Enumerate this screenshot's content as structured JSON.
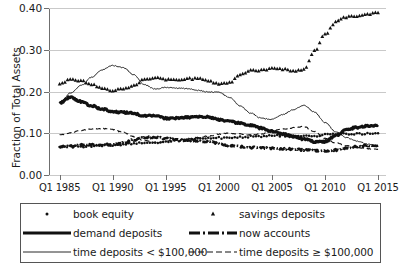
{
  "chart_data": {
    "type": "line",
    "title": "",
    "xlabel": "",
    "ylabel": "Fraction of Total Assets",
    "ylim": [
      0.0,
      0.4
    ],
    "xlim": [
      1984.0,
      2015.75
    ],
    "grid": true,
    "legend_position": "below-plot",
    "yticks": [
      "0.00",
      "0.10",
      "0.20",
      "0.30",
      "0.40"
    ],
    "ytick_values": [
      0.0,
      0.1,
      0.2,
      0.3,
      0.4
    ],
    "xticks": [
      "Q1 1985",
      "Q1 1990",
      "Q1 1995",
      "Q1 2000",
      "Q1 2005",
      "Q1 2010",
      "Q1 2015"
    ],
    "xtick_values": [
      1985,
      1990,
      1995,
      2000,
      2005,
      2010,
      2015
    ],
    "series": [
      {
        "name": "book equity",
        "style": "dotted-marker",
        "marker": "dot",
        "x": [
          1985.0,
          1986.0,
          1987.0,
          1988.0,
          1989.0,
          1990.0,
          1991.0,
          1992.0,
          1993.0,
          1994.0,
          1995.0,
          1996.0,
          1997.0,
          1998.0,
          1999.0,
          2000.0,
          2001.0,
          2002.0,
          2003.0,
          2004.0,
          2005.0,
          2006.0,
          2007.0,
          2008.0,
          2009.0,
          2010.0,
          2011.0,
          2012.0,
          2013.0,
          2014.0,
          2015.0
        ],
        "values": [
          0.068,
          0.068,
          0.068,
          0.069,
          0.07,
          0.072,
          0.073,
          0.075,
          0.077,
          0.078,
          0.081,
          0.082,
          0.084,
          0.086,
          0.088,
          0.089,
          0.09,
          0.091,
          0.092,
          0.093,
          0.094,
          0.094,
          0.094,
          0.093,
          0.094,
          0.096,
          0.097,
          0.098,
          0.098,
          0.099,
          0.1
        ]
      },
      {
        "name": "savings deposits",
        "style": "triangle-marker",
        "marker": "triangle",
        "x": [
          1985.0,
          1986.0,
          1987.0,
          1988.0,
          1989.0,
          1990.0,
          1991.0,
          1992.0,
          1993.0,
          1994.0,
          1995.0,
          1996.0,
          1997.0,
          1998.0,
          1999.0,
          2000.0,
          2001.0,
          2002.0,
          2003.0,
          2004.0,
          2005.0,
          2006.0,
          2007.0,
          2008.0,
          2009.0,
          2010.0,
          2011.0,
          2012.0,
          2013.0,
          2014.0,
          2015.0
        ],
        "values": [
          0.217,
          0.228,
          0.227,
          0.218,
          0.208,
          0.203,
          0.206,
          0.216,
          0.228,
          0.233,
          0.228,
          0.229,
          0.231,
          0.231,
          0.227,
          0.218,
          0.222,
          0.24,
          0.251,
          0.25,
          0.258,
          0.253,
          0.25,
          0.252,
          0.297,
          0.337,
          0.366,
          0.378,
          0.381,
          0.385,
          0.389
        ]
      },
      {
        "name": "demand deposits",
        "style": "thick-solid",
        "x": [
          1985.0,
          1986.0,
          1987.0,
          1988.0,
          1989.0,
          1990.0,
          1991.0,
          1992.0,
          1993.0,
          1994.0,
          1995.0,
          1996.0,
          1997.0,
          1998.0,
          1999.0,
          2000.0,
          2001.0,
          2002.0,
          2003.0,
          2004.0,
          2005.0,
          2006.0,
          2007.0,
          2008.0,
          2009.0,
          2010.0,
          2011.0,
          2012.0,
          2013.0,
          2014.0,
          2015.0
        ],
        "values": [
          0.172,
          0.186,
          0.176,
          0.166,
          0.158,
          0.152,
          0.15,
          0.148,
          0.141,
          0.142,
          0.136,
          0.136,
          0.138,
          0.139,
          0.139,
          0.133,
          0.128,
          0.124,
          0.119,
          0.112,
          0.105,
          0.098,
          0.092,
          0.086,
          0.08,
          0.08,
          0.094,
          0.108,
          0.114,
          0.117,
          0.12
        ]
      },
      {
        "name": "now accounts",
        "style": "dash-dot-thick",
        "x": [
          1985.0,
          1986.0,
          1987.0,
          1988.0,
          1989.0,
          1990.0,
          1991.0,
          1992.0,
          1993.0,
          1994.0,
          1995.0,
          1996.0,
          1997.0,
          1998.0,
          1999.0,
          2000.0,
          2001.0,
          2002.0,
          2003.0,
          2004.0,
          2005.0,
          2006.0,
          2007.0,
          2008.0,
          2009.0,
          2010.0,
          2011.0,
          2012.0,
          2013.0,
          2014.0,
          2015.0
        ],
        "values": [
          0.068,
          0.069,
          0.072,
          0.073,
          0.072,
          0.073,
          0.077,
          0.084,
          0.09,
          0.091,
          0.087,
          0.085,
          0.083,
          0.082,
          0.08,
          0.075,
          0.071,
          0.068,
          0.066,
          0.065,
          0.064,
          0.063,
          0.062,
          0.06,
          0.058,
          0.058,
          0.06,
          0.064,
          0.068,
          0.07,
          0.071
        ]
      },
      {
        "name": "time deposits < $100,000",
        "style": "thin-solid",
        "x": [
          1985.0,
          1986.0,
          1987.0,
          1988.0,
          1989.0,
          1990.0,
          1991.0,
          1992.0,
          1993.0,
          1994.0,
          1995.0,
          1996.0,
          1997.0,
          1998.0,
          1999.0,
          2000.0,
          2001.0,
          2002.0,
          2003.0,
          2004.0,
          2005.0,
          2006.0,
          2007.0,
          2008.0,
          2009.0,
          2010.0,
          2011.0,
          2012.0,
          2013.0,
          2014.0,
          2015.0
        ],
        "values": [
          0.172,
          0.196,
          0.214,
          0.234,
          0.252,
          0.262,
          0.257,
          0.24,
          0.216,
          0.206,
          0.21,
          0.208,
          0.207,
          0.203,
          0.199,
          0.198,
          0.186,
          0.166,
          0.148,
          0.136,
          0.133,
          0.145,
          0.156,
          0.167,
          0.151,
          0.126,
          0.104,
          0.09,
          0.081,
          0.074,
          0.069
        ]
      },
      {
        "name": "time deposits ≥ $100,000",
        "style": "thin-dashed",
        "x": [
          1985.0,
          1986.0,
          1987.0,
          1988.0,
          1989.0,
          1990.0,
          1991.0,
          1992.0,
          1993.0,
          1994.0,
          1995.0,
          1996.0,
          1997.0,
          1998.0,
          1999.0,
          2000.0,
          2001.0,
          2002.0,
          2003.0,
          2004.0,
          2005.0,
          2006.0,
          2007.0,
          2008.0,
          2009.0,
          2010.0,
          2011.0,
          2012.0,
          2013.0,
          2014.0,
          2015.0
        ],
        "values": [
          0.096,
          0.101,
          0.107,
          0.11,
          0.111,
          0.109,
          0.102,
          0.092,
          0.082,
          0.077,
          0.081,
          0.084,
          0.087,
          0.09,
          0.093,
          0.098,
          0.1,
          0.098,
          0.096,
          0.098,
          0.105,
          0.11,
          0.113,
          0.116,
          0.104,
          0.088,
          0.077,
          0.07,
          0.066,
          0.063,
          0.062
        ]
      }
    ]
  },
  "legend": {
    "entries": [
      {
        "label": "book equity",
        "style": "dotted-marker"
      },
      {
        "label": "savings deposits",
        "style": "triangle-marker"
      },
      {
        "label": "demand deposits",
        "style": "thick-solid"
      },
      {
        "label": "now accounts",
        "style": "dash-dot-thick"
      },
      {
        "label": "time deposits < $100,000",
        "style": "thin-solid"
      },
      {
        "label": "time deposits ≥ $100,000",
        "style": "thin-dashed"
      }
    ]
  },
  "colors": {
    "ink": "#111111",
    "grid": "#c9c9c9",
    "axis": "#6f6f6f",
    "background": "#ffffff"
  }
}
